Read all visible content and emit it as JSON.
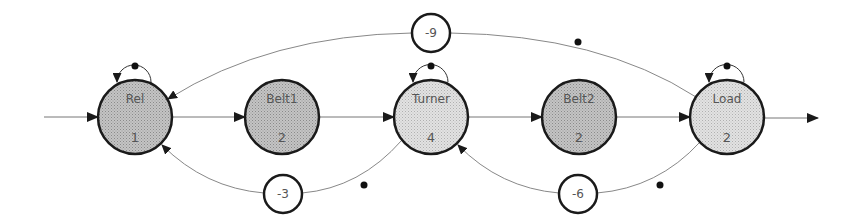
{
  "diagram": {
    "type": "petri-net / production flow",
    "colors": {
      "stroke": "#1a1a1a",
      "edge": "#888888",
      "node_fill_dark": "#bdbdbd",
      "node_fill_light": "#dcdcdc",
      "text": "#555555"
    },
    "nodes": [
      {
        "id": "rel",
        "label": "Rel",
        "value": "1",
        "cx": 135,
        "cy": 117,
        "shade": "dark"
      },
      {
        "id": "belt1",
        "label": "Belt1",
        "value": "2",
        "cx": 282,
        "cy": 117,
        "shade": "dark"
      },
      {
        "id": "turner",
        "label": "Turner",
        "value": "4",
        "cx": 431,
        "cy": 117,
        "shade": "light"
      },
      {
        "id": "belt2",
        "label": "Belt2",
        "value": "2",
        "cx": 579,
        "cy": 117,
        "shade": "dark"
      },
      {
        "id": "load",
        "label": "Load",
        "value": "2",
        "cx": 727,
        "cy": 117,
        "shade": "light"
      }
    ],
    "weights": [
      {
        "id": "w-top",
        "label": "-9",
        "cx": 431,
        "cy": 33
      },
      {
        "id": "w-bottom-left",
        "label": "-3",
        "cx": 283,
        "cy": 194
      },
      {
        "id": "w-bottom-right",
        "label": "-6",
        "cx": 578,
        "cy": 194
      }
    ],
    "edges": [
      {
        "from": "input",
        "to": "rel"
      },
      {
        "from": "rel",
        "to": "belt1"
      },
      {
        "from": "belt1",
        "to": "turner"
      },
      {
        "from": "turner",
        "to": "belt2"
      },
      {
        "from": "belt2",
        "to": "load"
      },
      {
        "from": "load",
        "to": "output"
      },
      {
        "from": "load",
        "to": "rel",
        "via": "-9"
      },
      {
        "from": "turner",
        "to": "rel",
        "via": "-3"
      },
      {
        "from": "load",
        "to": "turner",
        "via": "-6"
      },
      {
        "from": "rel",
        "to": "rel",
        "self_loop": true
      },
      {
        "from": "turner",
        "to": "turner",
        "self_loop": true
      },
      {
        "from": "load",
        "to": "load",
        "self_loop": true
      }
    ],
    "tokens": [
      {
        "x": 578,
        "y": 42
      },
      {
        "x": 364,
        "y": 185
      },
      {
        "x": 660,
        "y": 185
      }
    ]
  }
}
